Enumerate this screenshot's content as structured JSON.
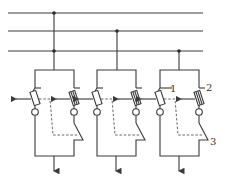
{
  "diagram": {
    "type": "electrical-schematic",
    "bus": {
      "lines_y": [
        13,
        31,
        51
      ],
      "x_start": 8,
      "x_end": 203
    },
    "units": [
      {
        "id": "unit-1",
        "x_left": 35,
        "x_right": 74,
        "tap_x": 54,
        "tap_bus_index": 0,
        "extra_junction_bus_index": 2
      },
      {
        "id": "unit-2",
        "x_left": 97,
        "x_right": 136,
        "tap_x": 117,
        "tap_bus_index": 1
      },
      {
        "id": "unit-3",
        "x_left": 160,
        "x_right": 199,
        "tap_x": 179,
        "tap_bus_index": 2
      }
    ],
    "labels": [
      {
        "text": "1",
        "x": 169,
        "y": 93
      },
      {
        "text": "2",
        "x": 206,
        "y": 92
      },
      {
        "text": "3",
        "x": 211,
        "y": 143
      }
    ],
    "colors": {
      "line": "#3a3a3a",
      "dashed": "#555555"
    }
  }
}
